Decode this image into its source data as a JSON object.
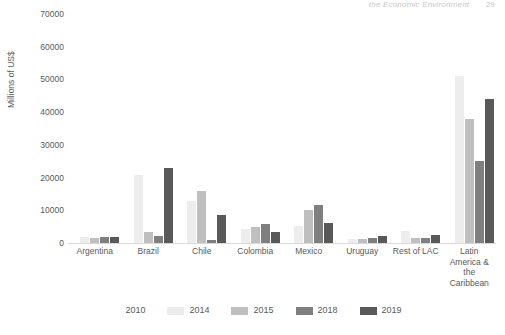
{
  "page_header": {
    "running_head": "the Economic Environment",
    "page_number": "29"
  },
  "chart_data": {
    "type": "bar",
    "title": "",
    "subtitle": "",
    "xlabel": "",
    "ylabel": "Millions of US$",
    "ylim": [
      0,
      70000
    ],
    "ytick_step": 10000,
    "yticks": [
      70000,
      60000,
      50000,
      40000,
      30000,
      20000,
      10000,
      0
    ],
    "ytick_labels": [
      "70000",
      "60000",
      "50000",
      "40000",
      "30000",
      "20000",
      "10000",
      "0"
    ],
    "grid": false,
    "legend_position": "bottom-center",
    "orientation": "vertical",
    "grouping": "grouped",
    "categories": [
      "Argentina",
      "Brazil",
      "Chile",
      "Colombia",
      "Mexico",
      "Uruguay",
      "Rest of LAC",
      "Latin America & the Caribbean"
    ],
    "category_label_lines": [
      [
        "Argentina"
      ],
      [
        "Brazil"
      ],
      [
        "Chile"
      ],
      [
        "Colombia"
      ],
      [
        "Mexico"
      ],
      [
        "Uruguay"
      ],
      [
        "Rest of LAC"
      ],
      [
        "Latin",
        "America &",
        "the",
        "Caribbean"
      ]
    ],
    "series": [
      {
        "name": "2010",
        "color": "#ffffff",
        "values": [
          0,
          0,
          0,
          0,
          0,
          0,
          0,
          0
        ]
      },
      {
        "name": "2014",
        "color": "#ededed",
        "values": [
          1900,
          20800,
          12800,
          4200,
          5200,
          1300,
          3800,
          51000
        ]
      },
      {
        "name": "2015",
        "color": "#bfbfbf",
        "values": [
          1500,
          3500,
          16000,
          5000,
          10000,
          1200,
          1600,
          38000
        ]
      },
      {
        "name": "2018",
        "color": "#7f7f7f",
        "values": [
          1700,
          2000,
          800,
          5700,
          11500,
          1500,
          1400,
          25000
        ]
      },
      {
        "name": "2019",
        "color": "#595959",
        "values": [
          1800,
          23000,
          8700,
          3500,
          6200,
          2100,
          2400,
          44000
        ]
      }
    ]
  }
}
